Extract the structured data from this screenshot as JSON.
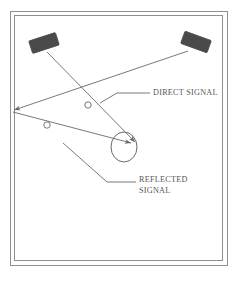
{
  "figure": {
    "name": "radar-multipath-diagram",
    "background_color": "#ffffff",
    "line_color": "#6a6a6a",
    "antenna_fill": "#4a4a4a",
    "frame_color": "#8a8a8a",
    "text_color": "#555555",
    "frame": {
      "outer": {
        "x": 10,
        "y": 11,
        "width": 218,
        "height": 255
      },
      "inner": {
        "x": 14,
        "y": 15,
        "width": 209,
        "height": 246
      }
    },
    "labels": {
      "direct_signal": "DIRECT SIGNAL",
      "reflected_signal_line1": "REFLECTED",
      "reflected_signal_line2": "SIGNAL"
    },
    "nodes": {
      "transmitter_left": {
        "cx": 44,
        "cy": 43,
        "width": 28,
        "height": 13,
        "rotation": -18
      },
      "transmitter_right": {
        "cx": 196,
        "cy": 42,
        "width": 28,
        "height": 13,
        "rotation": 20
      },
      "target": {
        "cx": 124,
        "cy": 147,
        "rx": 13,
        "ry": 15
      },
      "receiver_vertex": {
        "x": 12,
        "y": 111
      },
      "marker_direct": {
        "cx": 88,
        "cy": 105,
        "r": 3.2
      },
      "marker_reflected": {
        "cx": 47,
        "cy": 125,
        "r": 3.2
      }
    },
    "paths": {
      "direct_signal_beam": "M 47,52 L 134,141",
      "reflected_incoming_beam": "M 188,51 L 13,111",
      "reflected_outgoing_beam": "M 13,111 L 130,142",
      "leader_direct": "M 100,103 L 117,93 L 150,93",
      "leader_reflected": "M 63,143 L 107,182 L 136,182"
    },
    "text_positions": {
      "direct_signal": {
        "x": 153,
        "y": 93
      },
      "reflected_signal_line1": {
        "x": 139,
        "y": 180
      },
      "reflected_signal_line2": {
        "x": 139,
        "y": 191
      }
    }
  }
}
